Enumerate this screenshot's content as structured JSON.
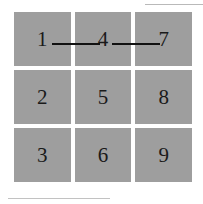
{
  "figure": {
    "cell_color": "#9e9e9e",
    "label_color": "#1a1a1a",
    "connector_color": "#111111",
    "background_color": "#ffffff",
    "rule_color": "#b9b9b9"
  },
  "grid": {
    "rows": 3,
    "columns": 3,
    "cells": [
      {
        "label": "1",
        "row": 1,
        "column": 1
      },
      {
        "label": "4",
        "row": 1,
        "column": 2
      },
      {
        "label": "7",
        "row": 1,
        "column": 3
      },
      {
        "label": "2",
        "row": 2,
        "column": 1
      },
      {
        "label": "5",
        "row": 2,
        "column": 2
      },
      {
        "label": "8",
        "row": 2,
        "column": 3
      },
      {
        "label": "3",
        "row": 3,
        "column": 1
      },
      {
        "label": "6",
        "row": 3,
        "column": 2
      },
      {
        "label": "9",
        "row": 3,
        "column": 3
      }
    ]
  },
  "connectors": [
    {
      "from": "1",
      "to": "4"
    },
    {
      "from": "4",
      "to": "7"
    }
  ],
  "rules": {
    "top_right": "",
    "bottom_left": ""
  }
}
